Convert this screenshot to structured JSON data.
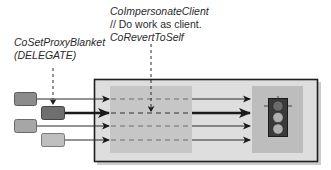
{
  "diagram": {
    "left_annotation": {
      "line1": "CoSetProxyBlanket",
      "line2": "(DELEGATE)"
    },
    "top_annotation": {
      "line1": "CoImpersonateClient",
      "line2": "// Do work as client.",
      "line3": "CoRevertToSelf"
    },
    "clients": [
      {
        "id": "client-1",
        "color": "#8c8c8c"
      },
      {
        "id": "client-2",
        "color": "#6f6f6f",
        "delegated": true
      },
      {
        "id": "client-3",
        "color": "#a6a6a6"
      },
      {
        "id": "client-4",
        "color": "#bfbfbf"
      }
    ],
    "server": {
      "frame_color": "#1e1e1e",
      "fill": "#dcdcdc",
      "impersonation_zone_fill": "#c4c4c4",
      "resource_zone_fill": "#bdbdbd"
    },
    "resource": {
      "icon": "traffic-light-icon",
      "lights": [
        "#6a6a6a",
        "#b0b0b0",
        "#b0b0b0"
      ]
    }
  }
}
